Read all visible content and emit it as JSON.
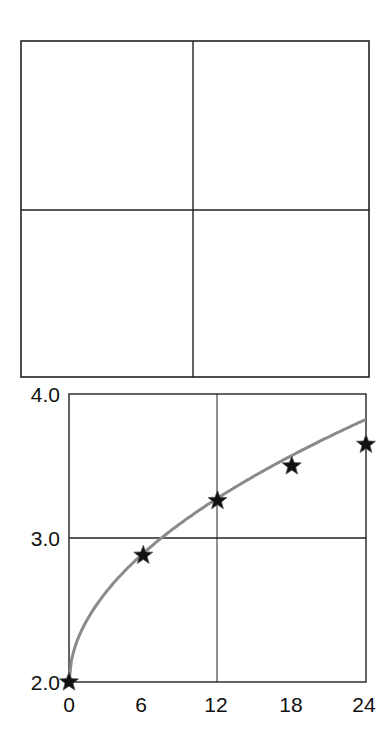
{
  "chart_data": [
    {
      "type": "table",
      "title": "",
      "description": "Empty 2x2 grid panel",
      "rows": 2,
      "cols": 2
    },
    {
      "type": "line",
      "title": "",
      "xlabel": "",
      "ylabel": "",
      "x": [
        0,
        6,
        12,
        18,
        24
      ],
      "series": [
        {
          "name": "",
          "marker": "star",
          "values": [
            2.0,
            2.88,
            3.26,
            3.5,
            3.65
          ]
        }
      ],
      "xlim": [
        0,
        24
      ],
      "ylim": [
        2.0,
        4.0
      ],
      "xticks": [
        "0",
        "6",
        "12",
        "18",
        "24"
      ],
      "yticks": [
        "2.0",
        "3.0",
        "4.0"
      ],
      "grid": {
        "x": [
          12
        ],
        "y": [
          3.0
        ]
      },
      "legend": null
    }
  ],
  "ticks": {
    "y": [
      "4.0",
      "3.0",
      "2.0"
    ],
    "x": [
      "0",
      "6",
      "12",
      "18",
      "24"
    ]
  },
  "colors": {
    "frame": "#222222",
    "curve": "#8a8a8a",
    "marker": "#111111"
  }
}
